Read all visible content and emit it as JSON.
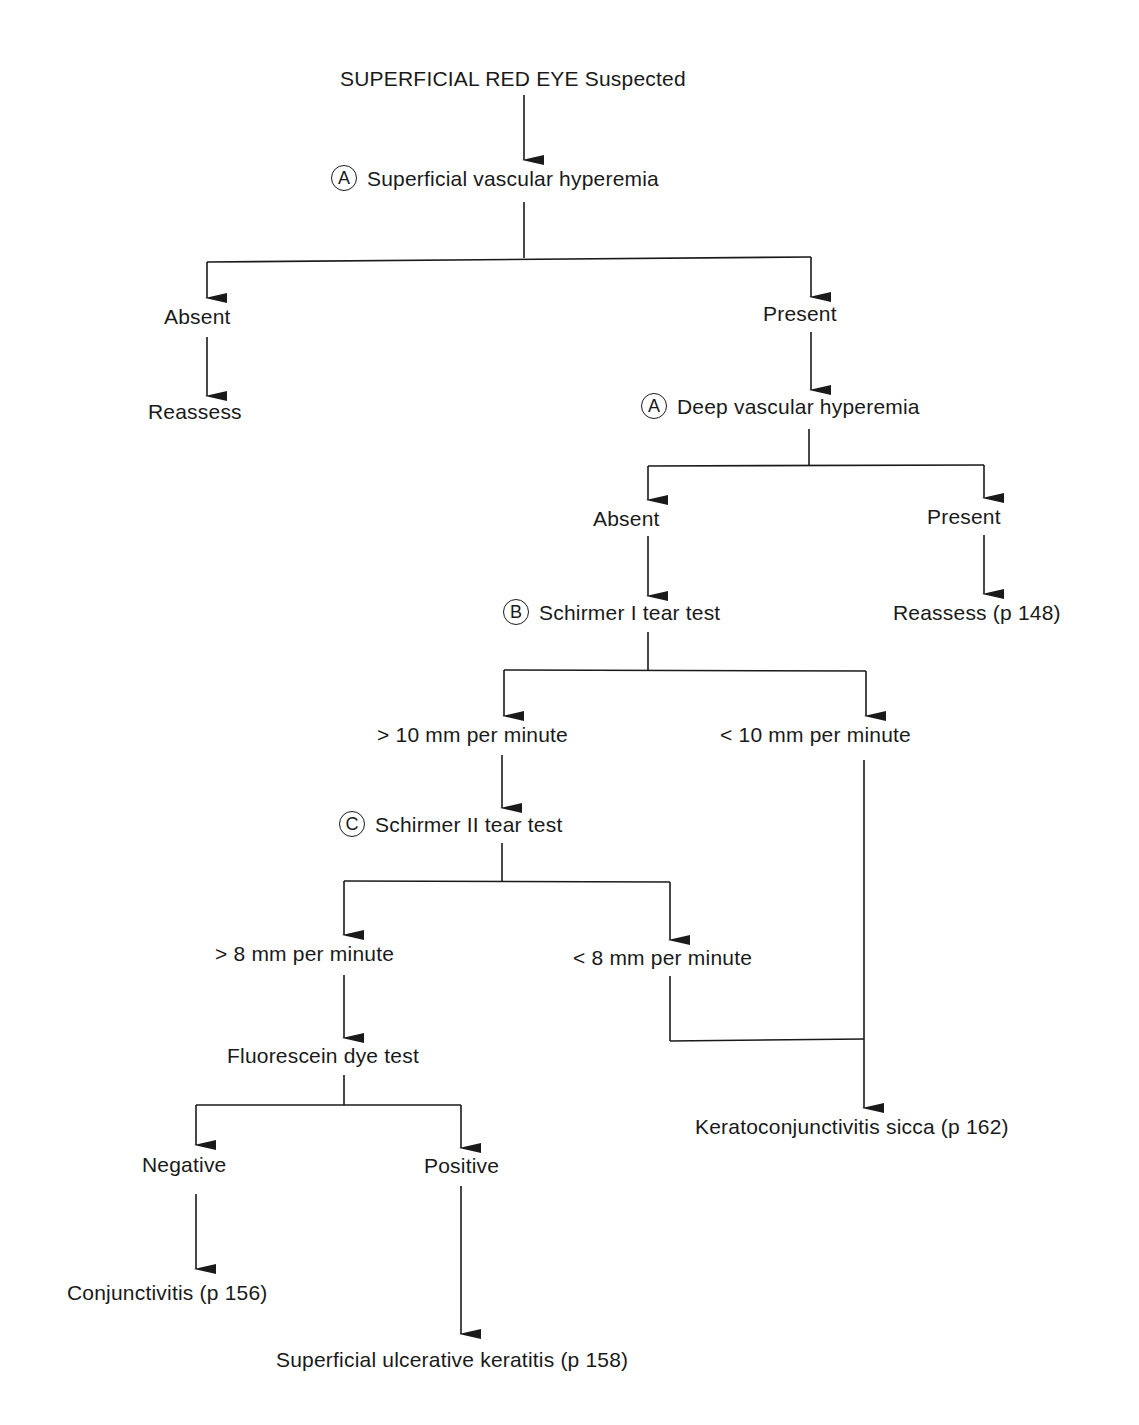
{
  "diagram": {
    "type": "flowchart",
    "title": "SUPERFICIAL RED EYE Suspected",
    "nodes": {
      "root": {
        "label": "SUPERFICIAL RED EYE Suspected"
      },
      "n1": {
        "badge": "A",
        "label": "Superficial vascular hyperemia"
      },
      "n1_absent": {
        "label": "Absent"
      },
      "n1_absent_out": {
        "label": "Reassess"
      },
      "n1_present": {
        "label": "Present"
      },
      "n2": {
        "badge": "A",
        "label": "Deep vascular hyperemia"
      },
      "n2_absent": {
        "label": "Absent"
      },
      "n2_present": {
        "label": "Present"
      },
      "n2_present_out": {
        "label": "Reassess (p 148)"
      },
      "n3": {
        "badge": "B",
        "label": "Schirmer I tear test"
      },
      "n3_gt": {
        "label": "> 10 mm per minute"
      },
      "n3_lt": {
        "label": "< 10 mm per minute"
      },
      "n4": {
        "badge": "C",
        "label": "Schirmer II tear test"
      },
      "n4_gt": {
        "label": "> 8 mm per minute"
      },
      "n4_lt": {
        "label": "< 8 mm per minute"
      },
      "n5": {
        "label": "Fluorescein dye test"
      },
      "n5_neg": {
        "label": "Negative"
      },
      "n5_pos": {
        "label": "Positive"
      },
      "out_conj": {
        "label": "Conjunctivitis (p 156)"
      },
      "out_ulcer": {
        "label": "Superficial ulcerative keratitis (p 158)"
      },
      "out_kcs": {
        "label": "Keratoconjunctivitis sicca (p 162)"
      }
    },
    "edges": [
      [
        "root",
        "n1"
      ],
      [
        "n1",
        "n1_absent"
      ],
      [
        "n1",
        "n1_present"
      ],
      [
        "n1_absent",
        "n1_absent_out"
      ],
      [
        "n1_present",
        "n2"
      ],
      [
        "n2",
        "n2_absent"
      ],
      [
        "n2",
        "n2_present"
      ],
      [
        "n2_present",
        "n2_present_out"
      ],
      [
        "n2_absent",
        "n3"
      ],
      [
        "n3",
        "n3_gt"
      ],
      [
        "n3",
        "n3_lt"
      ],
      [
        "n3_gt",
        "n4"
      ],
      [
        "n3_lt",
        "out_kcs"
      ],
      [
        "n4",
        "n4_gt"
      ],
      [
        "n4",
        "n4_lt"
      ],
      [
        "n4_lt",
        "out_kcs"
      ],
      [
        "n4_gt",
        "n5"
      ],
      [
        "n5",
        "n5_neg"
      ],
      [
        "n5",
        "n5_pos"
      ],
      [
        "n5_neg",
        "out_conj"
      ],
      [
        "n5_pos",
        "out_ulcer"
      ]
    ]
  }
}
